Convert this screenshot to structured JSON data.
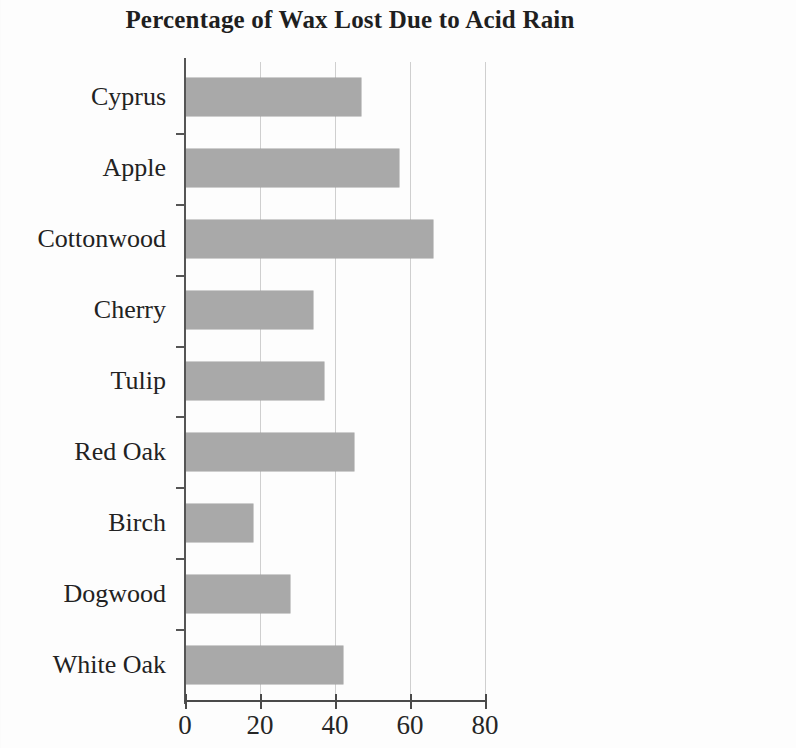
{
  "chart_data": {
    "type": "bar",
    "orientation": "horizontal",
    "title": "Percentage of Wax Lost Due to Acid Rain",
    "xlabel": "",
    "ylabel": "",
    "xlim": [
      0,
      80
    ],
    "ylim": null,
    "grid": true,
    "legend": null,
    "bar_color": "#a9a9a9",
    "axis_color": "#4a4a4a",
    "gridline_color": "#cfcfcf",
    "x_ticks": [
      0,
      20,
      40,
      60,
      80
    ],
    "x_tick_labels": [
      "0",
      "20",
      "40",
      "60",
      "80"
    ],
    "categories": [
      "Cyprus",
      "Apple",
      "Cottonwood",
      "Cherry",
      "Tulip",
      "Red Oak",
      "Birch",
      "Dogwood",
      "White Oak"
    ],
    "values": [
      47,
      57,
      66,
      34,
      37,
      45,
      18,
      28,
      42
    ]
  }
}
